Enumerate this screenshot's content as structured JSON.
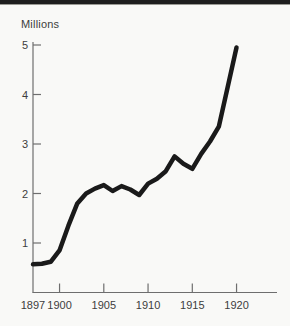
{
  "page": {
    "background_color": "#f9f9f7",
    "top_rule_color": "#1e1e1e"
  },
  "chart_data": {
    "type": "line",
    "title": "",
    "xlabel": "",
    "ylabel": "Millions",
    "x": [
      1897,
      1898,
      1899,
      1900,
      1901,
      1902,
      1903,
      1904,
      1905,
      1906,
      1907,
      1908,
      1909,
      1910,
      1911,
      1912,
      1913,
      1914,
      1915,
      1916,
      1917,
      1918,
      1919,
      1920
    ],
    "values": [
      0.57,
      0.58,
      0.62,
      0.85,
      1.35,
      1.8,
      2.0,
      2.1,
      2.17,
      2.05,
      2.15,
      2.08,
      1.97,
      2.2,
      2.3,
      2.45,
      2.75,
      2.6,
      2.5,
      2.8,
      3.05,
      3.35,
      4.15,
      4.95
    ],
    "xticks": {
      "values": [
        1897,
        1900,
        1905,
        1910,
        1915,
        1920
      ],
      "labels": [
        "1897",
        "1900",
        "1905",
        "1910",
        "1915",
        "1920"
      ]
    },
    "yticks": {
      "values": [
        1,
        2,
        3,
        4,
        5
      ],
      "labels": [
        "1",
        "2",
        "3",
        "4",
        "5"
      ]
    },
    "xlim": [
      1897,
      1924.5
    ],
    "ylim": [
      0,
      5.05
    ],
    "grid": false,
    "legend": "none",
    "line_color": "#1a1a1a",
    "axis_color": "#6e6e6e",
    "label_color": "#3d3d3d"
  }
}
